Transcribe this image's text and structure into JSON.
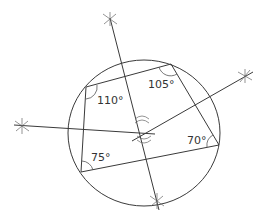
{
  "diagram": {
    "type": "cyclic-quadrilateral-construction",
    "circle": {
      "cx": 144,
      "cy": 133,
      "r": 75
    },
    "vertices": [
      {
        "id": "A",
        "x": 86,
        "y": 87,
        "angle_label": "110°"
      },
      {
        "id": "B",
        "x": 171,
        "y": 64,
        "angle_label": "105°"
      },
      {
        "id": "C",
        "x": 219,
        "y": 145,
        "angle_label": "70°"
      },
      {
        "id": "D",
        "x": 81,
        "y": 172,
        "angle_label": "75°"
      }
    ],
    "angle_labels": [
      {
        "text": "110°",
        "x": 97,
        "y": 104
      },
      {
        "text": "105°",
        "x": 148,
        "y": 88
      },
      {
        "text": "70°",
        "x": 187,
        "y": 144
      },
      {
        "text": "75°",
        "x": 91,
        "y": 161
      }
    ],
    "perpendicular_bisectors": [
      {
        "x1": 110,
        "y1": 18,
        "x2": 159,
        "y2": 210
      },
      {
        "x1": 14,
        "y1": 125,
        "x2": 155,
        "y2": 134
      },
      {
        "x1": 132,
        "y1": 141,
        "x2": 253,
        "y2": 72
      }
    ],
    "construction_marks": [
      {
        "x": 110,
        "y": 19
      },
      {
        "x": 245,
        "y": 76
      },
      {
        "x": 22,
        "y": 126
      },
      {
        "x": 157,
        "y": 201
      },
      {
        "x": 142,
        "y": 121
      },
      {
        "x": 144,
        "y": 138
      }
    ]
  }
}
